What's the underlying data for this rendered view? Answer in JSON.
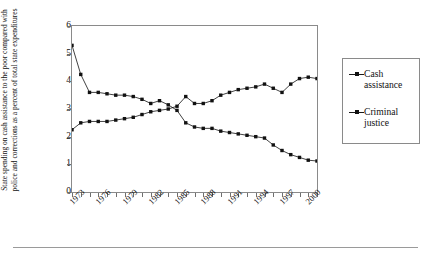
{
  "figure": {
    "name": "line-chart-state-spending",
    "ylabel": "State spending on cash assistance to the poor compared with police and corrections as a percent of total state expenditures"
  },
  "legend": {
    "position": "right",
    "items": [
      {
        "label": "Cash assistance",
        "marker": "square",
        "color": "#111111"
      },
      {
        "label": "Criminal justice",
        "marker": "square",
        "color": "#111111"
      }
    ]
  },
  "chart_data": {
    "type": "line",
    "title": "",
    "xlabel": "",
    "ylabel": "State spending on cash assistance to the poor compared with police and corrections as a percent of total state expenditures",
    "xlim": [
      1973,
      2001
    ],
    "ylim": [
      0,
      6
    ],
    "yticks": [
      0,
      1,
      2,
      3,
      4,
      5,
      6
    ],
    "xticks": [
      1973,
      1974,
      1975,
      1976,
      1977,
      1978,
      1979,
      1980,
      1981,
      1982,
      1983,
      1984,
      1985,
      1986,
      1987,
      1988,
      1989,
      1990,
      1991,
      1992,
      1993,
      1994,
      1995,
      1996,
      1997,
      1998,
      1999,
      2000,
      2001
    ],
    "xtick_labels": [
      "1973",
      "1976",
      "1979",
      "1982",
      "1985",
      "1988",
      "1991",
      "1994",
      "1997",
      "2000"
    ],
    "xtick_label_years": [
      1973,
      1976,
      1979,
      1982,
      1985,
      1988,
      1991,
      1994,
      1997,
      2000
    ],
    "grid": false,
    "legend_position": "right",
    "x": [
      1973,
      1974,
      1975,
      1976,
      1977,
      1978,
      1979,
      1980,
      1981,
      1982,
      1983,
      1984,
      1985,
      1986,
      1987,
      1988,
      1989,
      1990,
      1991,
      1992,
      1993,
      1994,
      1995,
      1996,
      1997,
      1998,
      1999,
      2000,
      2001
    ],
    "series": [
      {
        "name": "Cash assistance",
        "color": "#111111",
        "marker": "square",
        "values": [
          5.3,
          4.25,
          3.6,
          3.6,
          3.55,
          3.5,
          3.5,
          3.45,
          3.35,
          3.2,
          3.3,
          3.15,
          2.95,
          2.5,
          2.35,
          2.3,
          2.3,
          2.2,
          2.15,
          2.1,
          2.05,
          2.0,
          1.95,
          1.7,
          1.5,
          1.35,
          1.25,
          1.15,
          1.12
        ]
      },
      {
        "name": "Criminal justice",
        "color": "#111111",
        "marker": "square",
        "values": [
          2.25,
          2.5,
          2.55,
          2.55,
          2.55,
          2.6,
          2.65,
          2.7,
          2.8,
          2.9,
          2.95,
          3.0,
          3.1,
          3.45,
          3.2,
          3.2,
          3.3,
          3.5,
          3.6,
          3.7,
          3.75,
          3.8,
          3.9,
          3.75,
          3.6,
          3.9,
          4.1,
          4.15,
          4.1
        ]
      }
    ]
  }
}
